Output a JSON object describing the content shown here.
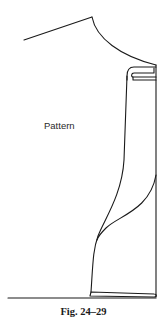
{
  "figure": {
    "label": "Pattern",
    "caption": "Fig. 24–29",
    "line_color": "#1a1a1a",
    "background": "#ffffff"
  }
}
